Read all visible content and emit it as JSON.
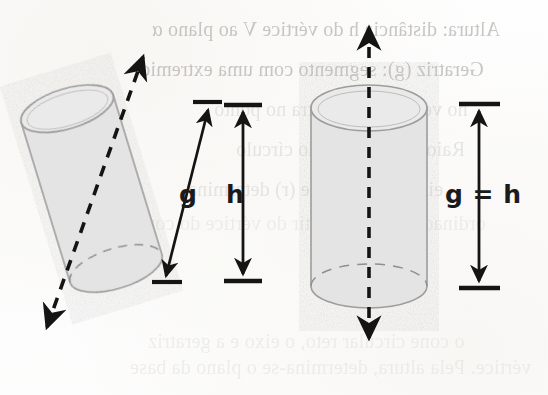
{
  "document": {
    "kind": "scanned-textbook-figure",
    "description": "Duas figuras de cilindro: um cilindro oblíquo (esquerda) e um cilindro reto (direita), com eixos tracejados e setas de medida."
  },
  "figure": {
    "left": {
      "name": "cilindro-obliquo",
      "generatrix_label": "g",
      "height_label": "h",
      "axis_style": "dashed-double-arrow",
      "tilted": true
    },
    "right": {
      "name": "cilindro-reto",
      "equality_label": "g = h",
      "axis_style": "dashed-double-arrow",
      "tilted": false
    }
  },
  "labels": {
    "g": "g",
    "h": "h",
    "g_equals_h": "g = h"
  },
  "colors": {
    "cylinder_fill": "#e4e4e4",
    "cylinder_stroke": "#9a9a9a",
    "ink": "#141414",
    "bleed_text": "#b9b6b1",
    "paper": "#fdfdfc"
  },
  "show_through_text": {
    "note": "Texto espelhado que transparece do verso da página",
    "lines": [
      {
        "id": "l1",
        "text": "Altura: distância h do vértice V ao plano α",
        "x": 152,
        "y": 18,
        "size": 20,
        "weight": "strong"
      },
      {
        "id": "l2",
        "text": "Geratriz (g): segmento com uma extremid",
        "x": 140,
        "y": 58,
        "size": 20,
        "weight": "strong"
      },
      {
        "id": "l3",
        "text": "no vértice V e a outra no ponto",
        "x": 214,
        "y": 98,
        "size": 20,
        "weight": "faint"
      },
      {
        "id": "l4",
        "text": "Raio: distância R do círculo",
        "x": 236,
        "y": 138,
        "size": 20,
        "weight": "faint"
      },
      {
        "id": "l5",
        "text": "eixo: reta suporte (r) determina",
        "x": 188,
        "y": 178,
        "size": 20,
        "weight": "faint"
      },
      {
        "id": "l6",
        "text": "ordinadas à reta a partir do vértice do cone",
        "x": 136,
        "y": 212,
        "size": 20,
        "weight": "vfaint"
      },
      {
        "id": "l7",
        "text": "o cone circular reto, o eixo e a geratriz",
        "x": 148,
        "y": 330,
        "size": 20,
        "weight": "vfaint"
      },
      {
        "id": "l8",
        "text": "vértice. Pela altura, determina-se o plano da base",
        "x": 130,
        "y": 356,
        "size": 20,
        "weight": "vfaint"
      }
    ]
  }
}
